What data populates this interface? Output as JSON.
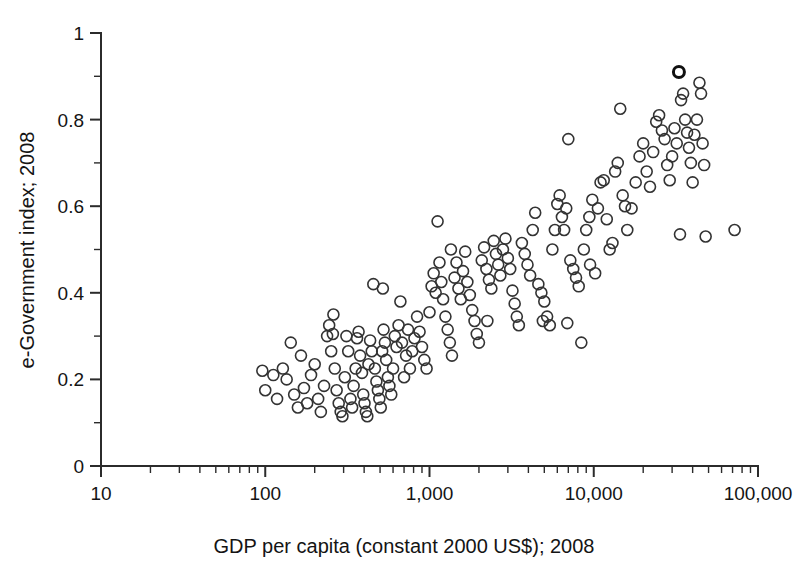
{
  "chart_data": {
    "type": "scatter",
    "title": "",
    "xlabel": "GDP per capita (constant 2000 US$); 2008",
    "ylabel": "e-Government index; 2008",
    "xscale": "log",
    "yscale": "linear",
    "xlim": [
      10,
      100000
    ],
    "ylim": [
      0,
      1
    ],
    "grid": false,
    "legend": null,
    "x_tick_labels": [
      "10",
      "100",
      "1,000",
      "10,000",
      "100,000"
    ],
    "x_tick_values": [
      10,
      100,
      1000,
      10000,
      100000
    ],
    "y_tick_labels": [
      "0",
      "0.2",
      "0.4",
      "0.6",
      "0.8",
      "1"
    ],
    "y_tick_values": [
      0,
      0.2,
      0.4,
      0.6,
      0.8,
      1
    ],
    "y_minor_tick_values": [
      0.1,
      0.3,
      0.5,
      0.7,
      0.9
    ],
    "marker": "open-circle",
    "marker_color": "#333333",
    "marker_size_px": 11,
    "n_points": 192,
    "series": [
      {
        "name": "countries",
        "points": [
          [
            96,
            0.22
          ],
          [
            100,
            0.175
          ],
          [
            112,
            0.21
          ],
          [
            118,
            0.155
          ],
          [
            128,
            0.225
          ],
          [
            135,
            0.2
          ],
          [
            143,
            0.285
          ],
          [
            150,
            0.165
          ],
          [
            158,
            0.135
          ],
          [
            165,
            0.255
          ],
          [
            172,
            0.18
          ],
          [
            180,
            0.145
          ],
          [
            190,
            0.21
          ],
          [
            200,
            0.235
          ],
          [
            210,
            0.155
          ],
          [
            218,
            0.125
          ],
          [
            228,
            0.185
          ],
          [
            238,
            0.3
          ],
          [
            245,
            0.325
          ],
          [
            252,
            0.265
          ],
          [
            258,
            0.305
          ],
          [
            265,
            0.225
          ],
          [
            272,
            0.175
          ],
          [
            280,
            0.145
          ],
          [
            288,
            0.125
          ],
          [
            295,
            0.115
          ],
          [
            305,
            0.205
          ],
          [
            312,
            0.3
          ],
          [
            320,
            0.265
          ],
          [
            330,
            0.155
          ],
          [
            338,
            0.135
          ],
          [
            345,
            0.185
          ],
          [
            355,
            0.225
          ],
          [
            362,
            0.295
          ],
          [
            370,
            0.31
          ],
          [
            378,
            0.255
          ],
          [
            388,
            0.215
          ],
          [
            395,
            0.165
          ],
          [
            402,
            0.145
          ],
          [
            410,
            0.125
          ],
          [
            418,
            0.115
          ],
          [
            425,
            0.235
          ],
          [
            435,
            0.29
          ],
          [
            445,
            0.265
          ],
          [
            455,
            0.42
          ],
          [
            465,
            0.225
          ],
          [
            475,
            0.195
          ],
          [
            485,
            0.175
          ],
          [
            495,
            0.155
          ],
          [
            505,
            0.135
          ],
          [
            515,
            0.265
          ],
          [
            525,
            0.315
          ],
          [
            535,
            0.285
          ],
          [
            545,
            0.245
          ],
          [
            558,
            0.205
          ],
          [
            570,
            0.185
          ],
          [
            585,
            0.165
          ],
          [
            600,
            0.225
          ],
          [
            615,
            0.3
          ],
          [
            630,
            0.275
          ],
          [
            648,
            0.325
          ],
          [
            665,
            0.38
          ],
          [
            680,
            0.285
          ],
          [
            700,
            0.205
          ],
          [
            720,
            0.255
          ],
          [
            740,
            0.315
          ],
          [
            760,
            0.225
          ],
          [
            785,
            0.265
          ],
          [
            810,
            0.295
          ],
          [
            840,
            0.345
          ],
          [
            870,
            0.31
          ],
          [
            900,
            0.275
          ],
          [
            930,
            0.245
          ],
          [
            960,
            0.225
          ],
          [
            1000,
            0.355
          ],
          [
            1030,
            0.415
          ],
          [
            1060,
            0.445
          ],
          [
            1090,
            0.4
          ],
          [
            1120,
            0.565
          ],
          [
            1150,
            0.47
          ],
          [
            1180,
            0.425
          ],
          [
            1210,
            0.385
          ],
          [
            1250,
            0.345
          ],
          [
            1290,
            0.315
          ],
          [
            1330,
            0.285
          ],
          [
            1370,
            0.255
          ],
          [
            1420,
            0.435
          ],
          [
            1460,
            0.47
          ],
          [
            1500,
            0.41
          ],
          [
            1550,
            0.385
          ],
          [
            1600,
            0.45
          ],
          [
            1650,
            0.495
          ],
          [
            1700,
            0.425
          ],
          [
            1760,
            0.395
          ],
          [
            1820,
            0.36
          ],
          [
            1880,
            0.335
          ],
          [
            1940,
            0.305
          ],
          [
            2000,
            0.285
          ],
          [
            2080,
            0.475
          ],
          [
            2150,
            0.505
          ],
          [
            2220,
            0.455
          ],
          [
            2300,
            0.43
          ],
          [
            2380,
            0.41
          ],
          [
            2460,
            0.52
          ],
          [
            2540,
            0.49
          ],
          [
            2620,
            0.465
          ],
          [
            2700,
            0.44
          ],
          [
            2800,
            0.5
          ],
          [
            2900,
            0.525
          ],
          [
            3000,
            0.48
          ],
          [
            3100,
            0.455
          ],
          [
            3200,
            0.405
          ],
          [
            3300,
            0.375
          ],
          [
            3400,
            0.345
          ],
          [
            3500,
            0.325
          ],
          [
            3650,
            0.515
          ],
          [
            3800,
            0.49
          ],
          [
            3950,
            0.465
          ],
          [
            4100,
            0.44
          ],
          [
            4250,
            0.545
          ],
          [
            4400,
            0.585
          ],
          [
            4600,
            0.42
          ],
          [
            4800,
            0.4
          ],
          [
            5000,
            0.38
          ],
          [
            5200,
            0.345
          ],
          [
            5400,
            0.325
          ],
          [
            5600,
            0.5
          ],
          [
            5800,
            0.545
          ],
          [
            6000,
            0.605
          ],
          [
            6200,
            0.625
          ],
          [
            6400,
            0.575
          ],
          [
            6600,
            0.545
          ],
          [
            6800,
            0.595
          ],
          [
            7000,
            0.755
          ],
          [
            7200,
            0.475
          ],
          [
            7500,
            0.455
          ],
          [
            7800,
            0.435
          ],
          [
            8100,
            0.415
          ],
          [
            8400,
            0.285
          ],
          [
            8700,
            0.5
          ],
          [
            9000,
            0.545
          ],
          [
            9400,
            0.575
          ],
          [
            9800,
            0.615
          ],
          [
            10200,
            0.445
          ],
          [
            10600,
            0.595
          ],
          [
            11000,
            0.655
          ],
          [
            11500,
            0.66
          ],
          [
            12000,
            0.57
          ],
          [
            12500,
            0.5
          ],
          [
            13000,
            0.515
          ],
          [
            13500,
            0.68
          ],
          [
            14000,
            0.7
          ],
          [
            14500,
            0.825
          ],
          [
            15000,
            0.625
          ],
          [
            15500,
            0.6
          ],
          [
            16000,
            0.545
          ],
          [
            17000,
            0.595
          ],
          [
            18000,
            0.655
          ],
          [
            19000,
            0.715
          ],
          [
            20000,
            0.745
          ],
          [
            21000,
            0.68
          ],
          [
            22000,
            0.645
          ],
          [
            23000,
            0.725
          ],
          [
            24000,
            0.795
          ],
          [
            25000,
            0.81
          ],
          [
            26000,
            0.775
          ],
          [
            27000,
            0.755
          ],
          [
            28000,
            0.695
          ],
          [
            29000,
            0.66
          ],
          [
            30000,
            0.715
          ],
          [
            31000,
            0.78
          ],
          [
            32000,
            0.745
          ],
          [
            33000,
            0.91
          ],
          [
            34000,
            0.845
          ],
          [
            35000,
            0.86
          ],
          [
            36000,
            0.8
          ],
          [
            37000,
            0.77
          ],
          [
            38000,
            0.735
          ],
          [
            39000,
            0.7
          ],
          [
            40000,
            0.655
          ],
          [
            41000,
            0.765
          ],
          [
            42500,
            0.8
          ],
          [
            44000,
            0.885
          ],
          [
            45000,
            0.86
          ],
          [
            46000,
            0.745
          ],
          [
            47000,
            0.695
          ],
          [
            33500,
            0.535
          ],
          [
            48000,
            0.53
          ],
          [
            72000,
            0.545
          ],
          [
            260,
            0.35
          ],
          [
            520,
            0.41
          ],
          [
            1350,
            0.5
          ],
          [
            2250,
            0.335
          ],
          [
            4900,
            0.335
          ],
          [
            6900,
            0.33
          ],
          [
            9500,
            0.465
          ]
        ]
      }
    ]
  },
  "axes": {
    "x_title": "GDP per capita (constant 2000 US$); 2008",
    "y_title": "e-Government index; 2008"
  }
}
